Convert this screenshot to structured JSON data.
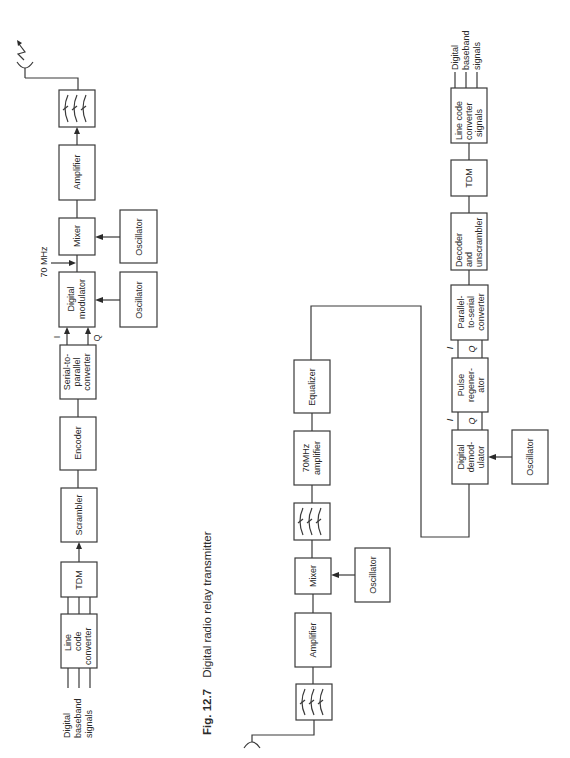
{
  "figure": {
    "number": "Fig. 12.7",
    "caption": "Digital radio relay transmitter"
  },
  "transmitter": {
    "input_label": [
      "Digital",
      "baseband",
      "signals"
    ],
    "blocks": {
      "line_code_converter": [
        "Line",
        "code",
        "converter"
      ],
      "tdm": [
        "TDM"
      ],
      "scrambler": [
        "Scrambler"
      ],
      "encoder": [
        "Encoder"
      ],
      "serial_to_parallel": [
        "Serial-to-",
        "parallel",
        "converter"
      ],
      "digital_modulator": [
        "Digital",
        "modulator"
      ],
      "oscillator_mod": [
        "Oscillator"
      ],
      "mixer": [
        "Mixer"
      ],
      "oscillator_mix": [
        "Oscillator"
      ],
      "amplifier": [
        "Amplifier"
      ],
      "filter": "bandpass-filter"
    },
    "if_label": "70 MHz",
    "i_label": "I",
    "q_label": "Q",
    "antenna": "transmit-antenna"
  },
  "receiver": {
    "blocks": {
      "filter": "bandpass-filter",
      "amplifier": [
        "Amplifier"
      ],
      "mixer": [
        "Mixer"
      ],
      "oscillator_mix": [
        "Oscillator"
      ],
      "filter2": "bandpass-filter",
      "if_amplifier": [
        "70MHz",
        "amplifier"
      ],
      "equalizer": [
        "Equalizer"
      ],
      "digital_demodulator": [
        "Digital",
        "demod-",
        "ulator"
      ],
      "oscillator_demod": [
        "Oscillator"
      ],
      "pulse_regenerator": [
        "Pulse",
        "regener-",
        "ator"
      ],
      "parallel_to_serial": [
        "Parallel-",
        "to-serial",
        "converter"
      ],
      "decoder_unscrambler": [
        "Decoder",
        "and",
        "unscrambler"
      ],
      "tdm": [
        "TDM"
      ],
      "line_code_converter": [
        "Line code",
        "converter",
        "signals"
      ]
    },
    "i_label": "I",
    "q_label": "Q",
    "output_label": [
      "Digital",
      "baseband",
      "signals"
    ],
    "antenna": "receive-antenna"
  }
}
